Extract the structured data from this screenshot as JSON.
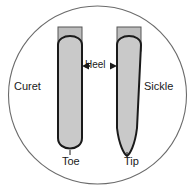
{
  "figure": {
    "type": "dental-instrument-comparison-diagram",
    "shape": "circle",
    "background_color": "#ffffff",
    "outline_color": "#6b6b6b",
    "blade_fill_color": "#c9c9c9",
    "blade_outline_color": "#1a1a1a",
    "shaft_fill_color": "#bdbdbd",
    "text_color": "#1a1a1a"
  },
  "labels": {
    "curet": "Curet",
    "sickle": "Sickle",
    "toe": "Toe",
    "tip": "Tip",
    "heel": "Heel"
  },
  "instruments": [
    {
      "name": "curet",
      "label": "Curet",
      "end_label": "Toe",
      "end_shape": "rounded",
      "side": "left"
    },
    {
      "name": "sickle",
      "label": "Sickle",
      "end_label": "Tip",
      "end_shape": "pointed",
      "side": "right"
    }
  ],
  "annotations": {
    "heel": {
      "text": "Heel",
      "arrow_left": "◀",
      "arrow_right": "▶"
    }
  }
}
